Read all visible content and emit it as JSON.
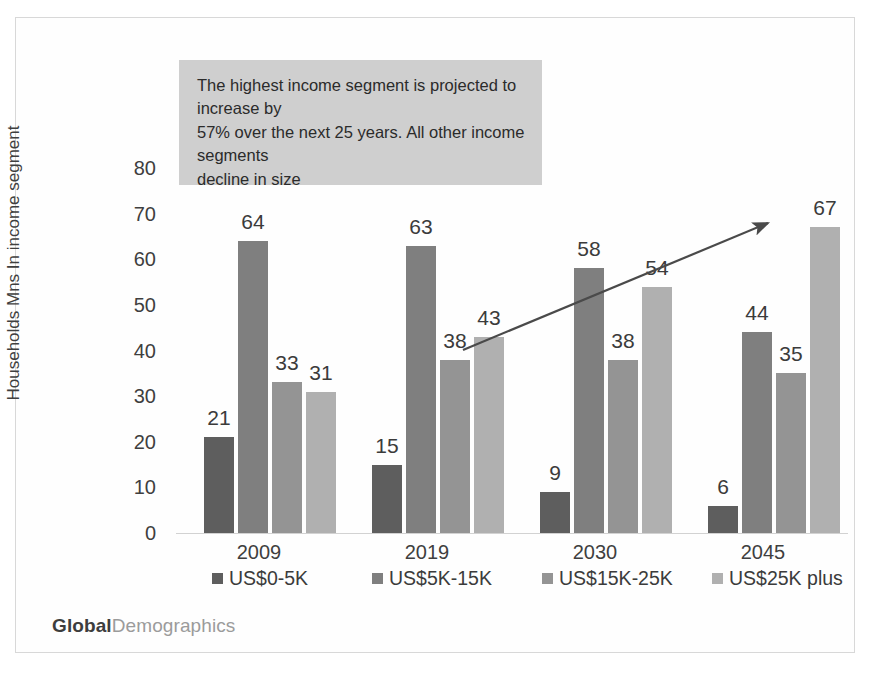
{
  "chart_data": {
    "type": "bar",
    "title": "",
    "xlabel": "",
    "ylabel": "Households Mns In income segment",
    "ylim": [
      0,
      80
    ],
    "ytick_step": 10,
    "yticks": [
      "80",
      "70",
      "60",
      "50",
      "40",
      "30",
      "20",
      "10",
      "0"
    ],
    "grid": false,
    "legend_position": "bottom",
    "categories": [
      "2009",
      "2019",
      "2030",
      "2045"
    ],
    "series": [
      {
        "name": "US$0-5K",
        "color": "#5e5e5e",
        "values": [
          21,
          64,
          33,
          31
        ]
      },
      {
        "name": "US$5K-15K",
        "color": "#7f7f7f",
        "values": [
          15,
          63,
          38,
          43
        ]
      },
      {
        "name": "US$15K-25K",
        "color": "#949494",
        "values": [
          9,
          58,
          38,
          54
        ]
      },
      {
        "name": "US$25K plus",
        "color": "#b0b0b0",
        "values": [
          6,
          44,
          35,
          67
        ]
      }
    ],
    "groups": [
      {
        "category": "2009",
        "values": [
          21,
          64,
          33,
          31
        ]
      },
      {
        "category": "2019",
        "values": [
          15,
          63,
          38,
          43
        ]
      },
      {
        "category": "2030",
        "values": [
          9,
          58,
          38,
          54
        ]
      },
      {
        "category": "2045",
        "values": [
          6,
          44,
          35,
          67
        ]
      }
    ],
    "annotations": [
      {
        "type": "textbox",
        "text": "The highest income segment is projected to increase by 57% over the next 25 years.  All other income segments decline in size",
        "background": "#cfcfcf"
      },
      {
        "type": "arrow",
        "direction": "up-right",
        "meaning": "rising trend of US$25K plus segment"
      }
    ]
  },
  "annotation": {
    "line1": "The highest income segment is projected to increase by",
    "line2": "57% over the next 25 years.  All other income segments",
    "line3": "decline in size"
  },
  "legend": {
    "items": [
      {
        "label": "US$0-5K",
        "color": "#5e5e5e"
      },
      {
        "label": "US$5K-15K",
        "color": "#7f7f7f"
      },
      {
        "label": "US$15K-25K",
        "color": "#949494"
      },
      {
        "label": "US$25K plus",
        "color": "#b0b0b0"
      }
    ]
  },
  "axis": {
    "y_title": "Households Mns In income segment",
    "y_ticks": [
      "80",
      "70",
      "60",
      "50",
      "40",
      "30",
      "20",
      "10",
      "0"
    ],
    "x_labels": [
      "2009",
      "2019",
      "2030",
      "2045"
    ]
  },
  "values": {
    "g0": [
      "21",
      "64",
      "33",
      "31"
    ],
    "g1": [
      "15",
      "63",
      "38",
      "43"
    ],
    "g2": [
      "9",
      "58",
      "38",
      "54"
    ],
    "g3": [
      "6",
      "44",
      "35",
      "67"
    ]
  },
  "logo": {
    "part1": "Global",
    "part2": "Demographics"
  }
}
